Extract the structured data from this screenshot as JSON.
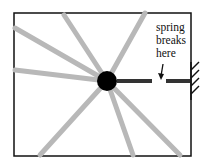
{
  "diagram": {
    "annotation": [
      "spring",
      "breaks",
      "here"
    ],
    "colors": {
      "frame": "#111111",
      "spring_gray": "#b8b8b8",
      "spring_dark": "#333333",
      "ball": "#000000",
      "wall": "#111111"
    },
    "elements": {
      "ball": "mass",
      "intact_spring": "horizontal-spring-to-wall",
      "faded_springs": 8,
      "wall": "hatched-wall-right"
    }
  }
}
